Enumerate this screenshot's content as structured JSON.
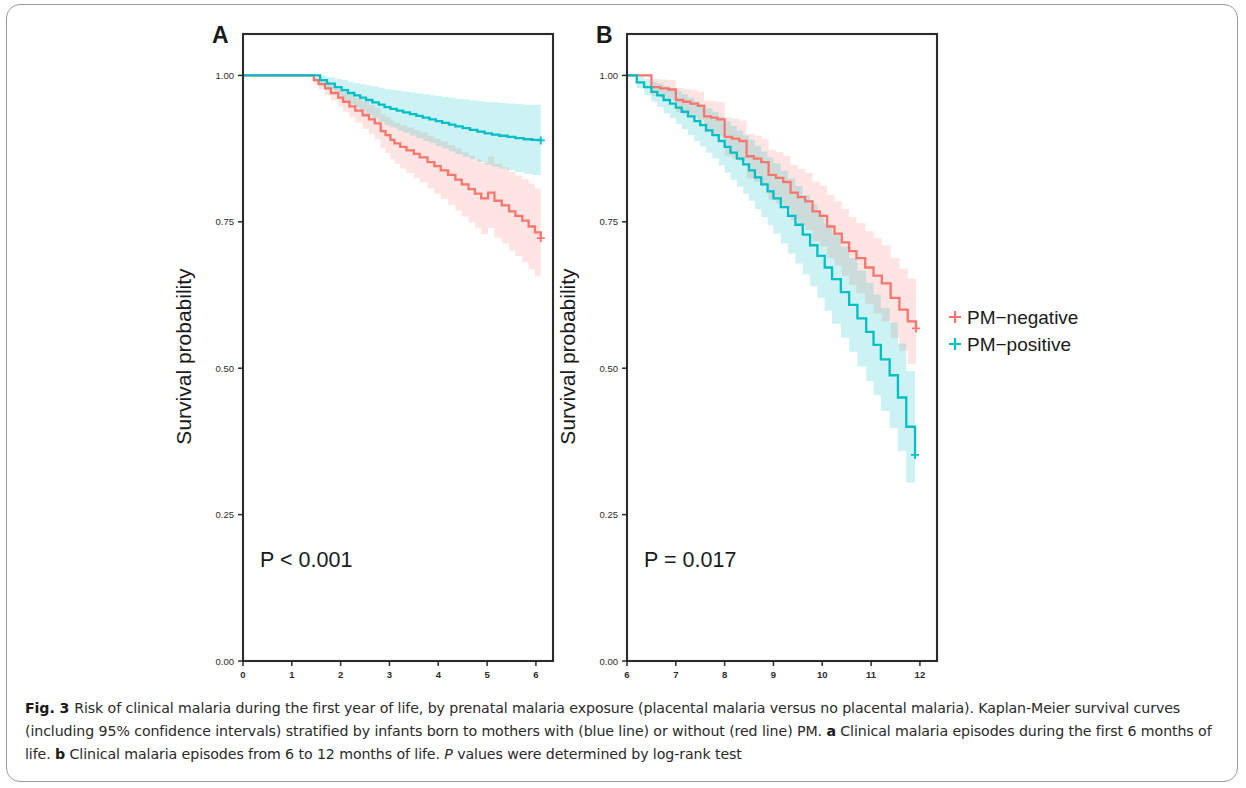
{
  "figure": {
    "label": "Fig. 3",
    "caption_segments": [
      {
        "text": "Fig. 3 ",
        "style": "bold"
      },
      {
        "text": "Risk of clinical malaria during the first year of life, by prenatal malaria exposure (placental malaria versus no placental malaria). Kaplan-Meier survival curves (including 95% confidence intervals) stratified by infants born to mothers with (blue line) or without (red line) PM. ",
        "style": "normal"
      },
      {
        "text": "a",
        "style": "bold"
      },
      {
        "text": " Clinical malaria episodes during the first 6 months of life. ",
        "style": "normal"
      },
      {
        "text": "b",
        "style": "bold"
      },
      {
        "text": " Clinical malaria episodes from 6 to 12 months of life. ",
        "style": "normal"
      },
      {
        "text": "P",
        "style": "italic"
      },
      {
        "text": " values were determined by log-rank test",
        "style": "normal"
      }
    ],
    "caption_plain": "Fig. 3 Risk of clinical malaria during the first year of life, by prenatal malaria exposure (placental malaria versus no placental malaria). Kaplan-Meier survival curves (including 95% confidence intervals) stratified by infants born to mothers with (blue line) or without (red line) PM. a Clinical malaria episodes during the first 6 months of life. b Clinical malaria episodes from 6 to 12 months of life. P values were determined by log-rank test"
  },
  "colors": {
    "pm_negative": "#F8766D",
    "pm_positive": "#00BFC4",
    "pm_negative_band": "#F8766D",
    "pm_positive_band": "#00BFC4",
    "axis": "#2b2b2b",
    "frame": "#9a9a9a",
    "text": "#1a1a1a"
  },
  "legend": {
    "position": "right",
    "items": [
      {
        "label": "PM−negative",
        "color": "#F8766D",
        "marker": "plus"
      },
      {
        "label": "PM−positive",
        "color": "#00BFC4",
        "marker": "plus"
      }
    ]
  },
  "chart_data": [
    {
      "type": "line",
      "panel": "A",
      "panel_letter": "A",
      "panel_ref": "a",
      "title": "",
      "xlabel": "Months to malaria",
      "ylabel": "Survival probability",
      "xlim": [
        0,
        6.35
      ],
      "ylim": [
        0,
        1.04
      ],
      "xticks": [
        0,
        1,
        2,
        3,
        4,
        5,
        6
      ],
      "xtick_labels": [
        "0",
        "1",
        "2",
        "3",
        "4",
        "5",
        "6"
      ],
      "yticks": [
        0.0,
        0.25,
        0.5,
        0.75,
        1.0
      ],
      "ytick_labels": [
        "0.00",
        "0.25",
        "0.50",
        "0.75",
        "1.00"
      ],
      "grid": false,
      "annotation": "P < 0.001",
      "annotation_x": 0.35,
      "annotation_y": 0.16,
      "series": [
        {
          "name": "PM−negative",
          "color": "#F8766D",
          "x": [
            0,
            1.3,
            1.45,
            1.55,
            1.68,
            1.8,
            1.95,
            2.05,
            2.18,
            2.3,
            2.45,
            2.58,
            2.7,
            2.82,
            2.92,
            3.02,
            3.1,
            3.22,
            3.35,
            3.5,
            3.62,
            3.78,
            3.92,
            4.05,
            4.2,
            4.35,
            4.48,
            4.62,
            4.75,
            4.88,
            5.02,
            5.15,
            5.3,
            5.45,
            5.58,
            5.72,
            5.85,
            5.98,
            6.1
          ],
          "y": [
            1.0,
            1.0,
            0.992,
            0.985,
            0.978,
            0.97,
            0.962,
            0.955,
            0.947,
            0.94,
            0.932,
            0.925,
            0.918,
            0.905,
            0.898,
            0.89,
            0.884,
            0.878,
            0.872,
            0.866,
            0.86,
            0.852,
            0.845,
            0.838,
            0.83,
            0.822,
            0.814,
            0.806,
            0.798,
            0.79,
            0.8,
            0.786,
            0.778,
            0.768,
            0.76,
            0.752,
            0.742,
            0.732,
            0.722
          ],
          "ci_lower": [
            1.0,
            1.0,
            0.985,
            0.976,
            0.967,
            0.957,
            0.947,
            0.938,
            0.928,
            0.919,
            0.909,
            0.9,
            0.891,
            0.876,
            0.867,
            0.857,
            0.849,
            0.841,
            0.833,
            0.825,
            0.817,
            0.807,
            0.798,
            0.789,
            0.779,
            0.769,
            0.759,
            0.749,
            0.739,
            0.729,
            0.739,
            0.723,
            0.713,
            0.701,
            0.691,
            0.681,
            0.669,
            0.657,
            0.645
          ],
          "ci_upper": [
            1.0,
            1.0,
            0.998,
            0.994,
            0.989,
            0.983,
            0.977,
            0.972,
            0.966,
            0.961,
            0.955,
            0.95,
            0.945,
            0.934,
            0.929,
            0.923,
            0.919,
            0.915,
            0.911,
            0.907,
            0.903,
            0.897,
            0.892,
            0.887,
            0.881,
            0.875,
            0.869,
            0.863,
            0.857,
            0.851,
            0.861,
            0.849,
            0.843,
            0.835,
            0.829,
            0.823,
            0.815,
            0.807,
            0.799
          ],
          "final_value": 0.722,
          "censor_marks": [
            [
              6.1,
              0.722
            ]
          ]
        },
        {
          "name": "PM−positive",
          "color": "#00BFC4",
          "x": [
            0,
            1.42,
            1.58,
            1.72,
            1.88,
            2.02,
            2.15,
            2.28,
            2.4,
            2.52,
            2.65,
            2.78,
            2.9,
            3.02,
            3.15,
            3.28,
            3.42,
            3.55,
            3.68,
            3.82,
            3.95,
            4.08,
            4.22,
            4.35,
            4.5,
            4.65,
            4.8,
            4.95,
            5.1,
            5.25,
            5.42,
            5.58,
            5.75,
            5.92,
            6.1
          ],
          "y": [
            1.0,
            1.0,
            0.992,
            0.986,
            0.98,
            0.975,
            0.97,
            0.966,
            0.962,
            0.958,
            0.954,
            0.95,
            0.946,
            0.943,
            0.94,
            0.937,
            0.934,
            0.931,
            0.928,
            0.925,
            0.922,
            0.919,
            0.916,
            0.913,
            0.91,
            0.907,
            0.904,
            0.901,
            0.899,
            0.897,
            0.895,
            0.893,
            0.891,
            0.89,
            0.889
          ],
          "ci_lower": [
            1.0,
            1.0,
            0.984,
            0.975,
            0.966,
            0.958,
            0.951,
            0.945,
            0.939,
            0.933,
            0.927,
            0.921,
            0.915,
            0.911,
            0.906,
            0.902,
            0.897,
            0.893,
            0.888,
            0.884,
            0.879,
            0.875,
            0.87,
            0.866,
            0.861,
            0.857,
            0.852,
            0.848,
            0.844,
            0.841,
            0.838,
            0.835,
            0.832,
            0.83,
            0.828
          ],
          "ci_upper": [
            1.0,
            1.0,
            0.999,
            0.997,
            0.994,
            0.992,
            0.989,
            0.987,
            0.985,
            0.983,
            0.981,
            0.979,
            0.977,
            0.975,
            0.974,
            0.972,
            0.971,
            0.969,
            0.968,
            0.966,
            0.965,
            0.963,
            0.962,
            0.96,
            0.959,
            0.957,
            0.956,
            0.954,
            0.954,
            0.953,
            0.952,
            0.951,
            0.95,
            0.95,
            0.95
          ],
          "final_value": 0.889,
          "censor_marks": [
            [
              6.1,
              0.889
            ]
          ]
        }
      ]
    },
    {
      "type": "line",
      "panel": "B",
      "panel_letter": "B",
      "panel_ref": "b",
      "title": "",
      "xlabel": "Months to malaria",
      "ylabel": "Survival probability",
      "xlim": [
        6,
        12.35
      ],
      "ylim": [
        0,
        1.04
      ],
      "xticks": [
        6,
        7,
        8,
        9,
        10,
        11,
        12
      ],
      "xtick_labels": [
        "6",
        "7",
        "8",
        "9",
        "10",
        "11",
        "12"
      ],
      "yticks": [
        0.0,
        0.25,
        0.5,
        0.75,
        1.0
      ],
      "ytick_labels": [
        "0.00",
        "0.25",
        "0.50",
        "0.75",
        "1.00"
      ],
      "grid": false,
      "annotation": "P = 0.017",
      "annotation_x": 6.35,
      "annotation_y": 0.16,
      "series": [
        {
          "name": "PM−negative",
          "color": "#F8766D",
          "x": [
            6.0,
            6.35,
            6.5,
            6.68,
            6.85,
            7.0,
            7.15,
            7.3,
            7.45,
            7.58,
            7.72,
            7.85,
            8.0,
            8.15,
            8.3,
            8.45,
            8.6,
            8.75,
            8.9,
            9.05,
            9.2,
            9.35,
            9.5,
            9.65,
            9.8,
            9.95,
            10.1,
            10.25,
            10.4,
            10.55,
            10.7,
            10.88,
            11.05,
            11.22,
            11.4,
            11.58,
            11.75,
            11.92
          ],
          "y": [
            1.0,
            1.0,
            0.98,
            0.978,
            0.976,
            0.958,
            0.955,
            0.952,
            0.948,
            0.93,
            0.928,
            0.925,
            0.895,
            0.892,
            0.888,
            0.862,
            0.858,
            0.852,
            0.83,
            0.825,
            0.818,
            0.8,
            0.792,
            0.785,
            0.768,
            0.76,
            0.742,
            0.73,
            0.715,
            0.7,
            0.688,
            0.672,
            0.658,
            0.645,
            0.62,
            0.6,
            0.58,
            0.568
          ],
          "ci_lower": [
            1.0,
            1.0,
            0.965,
            0.962,
            0.959,
            0.937,
            0.933,
            0.929,
            0.924,
            0.903,
            0.9,
            0.896,
            0.862,
            0.858,
            0.853,
            0.824,
            0.819,
            0.812,
            0.787,
            0.781,
            0.773,
            0.753,
            0.744,
            0.736,
            0.717,
            0.708,
            0.688,
            0.675,
            0.658,
            0.642,
            0.628,
            0.61,
            0.594,
            0.58,
            0.552,
            0.53,
            0.507,
            0.492
          ],
          "ci_upper": [
            1.0,
            1.0,
            0.994,
            0.993,
            0.992,
            0.979,
            0.977,
            0.975,
            0.972,
            0.957,
            0.956,
            0.954,
            0.928,
            0.926,
            0.923,
            0.9,
            0.897,
            0.892,
            0.873,
            0.869,
            0.863,
            0.847,
            0.84,
            0.834,
            0.819,
            0.812,
            0.796,
            0.785,
            0.772,
            0.758,
            0.748,
            0.734,
            0.722,
            0.71,
            0.688,
            0.67,
            0.653,
            0.644
          ],
          "final_value": 0.568,
          "censor_marks": [
            [
              11.92,
              0.568
            ]
          ]
        },
        {
          "name": "PM−positive",
          "color": "#00BFC4",
          "x": [
            6.0,
            6.2,
            6.35,
            6.5,
            6.62,
            6.75,
            6.88,
            7.0,
            7.12,
            7.25,
            7.38,
            7.5,
            7.62,
            7.75,
            7.88,
            8.0,
            8.12,
            8.25,
            8.38,
            8.5,
            8.62,
            8.75,
            8.88,
            9.0,
            9.15,
            9.3,
            9.45,
            9.6,
            9.75,
            9.9,
            10.05,
            10.2,
            10.38,
            10.55,
            10.72,
            10.9,
            11.05,
            11.2,
            11.38,
            11.55,
            11.72,
            11.9
          ],
          "y": [
            1.0,
            0.988,
            0.98,
            0.972,
            0.966,
            0.958,
            0.952,
            0.945,
            0.938,
            0.93,
            0.922,
            0.915,
            0.906,
            0.898,
            0.888,
            0.878,
            0.868,
            0.858,
            0.848,
            0.838,
            0.826,
            0.814,
            0.802,
            0.79,
            0.775,
            0.76,
            0.745,
            0.728,
            0.71,
            0.692,
            0.672,
            0.652,
            0.63,
            0.608,
            0.585,
            0.562,
            0.54,
            0.515,
            0.488,
            0.45,
            0.4,
            0.352
          ],
          "ci_lower": [
            1.0,
            0.978,
            0.966,
            0.955,
            0.946,
            0.935,
            0.927,
            0.917,
            0.908,
            0.898,
            0.888,
            0.879,
            0.868,
            0.858,
            0.846,
            0.834,
            0.822,
            0.81,
            0.798,
            0.786,
            0.772,
            0.758,
            0.744,
            0.73,
            0.713,
            0.696,
            0.679,
            0.66,
            0.64,
            0.62,
            0.598,
            0.576,
            0.552,
            0.528,
            0.503,
            0.478,
            0.454,
            0.427,
            0.398,
            0.358,
            0.305,
            0.254
          ],
          "ci_upper": [
            1.0,
            0.998,
            0.994,
            0.989,
            0.986,
            0.981,
            0.977,
            0.973,
            0.968,
            0.962,
            0.956,
            0.951,
            0.944,
            0.938,
            0.93,
            0.922,
            0.914,
            0.906,
            0.898,
            0.89,
            0.88,
            0.87,
            0.86,
            0.85,
            0.837,
            0.824,
            0.811,
            0.796,
            0.78,
            0.764,
            0.746,
            0.728,
            0.708,
            0.688,
            0.667,
            0.646,
            0.626,
            0.603,
            0.578,
            0.542,
            0.495,
            0.45
          ],
          "final_value": 0.352,
          "censor_marks": [
            [
              11.9,
              0.352
            ]
          ]
        }
      ]
    }
  ]
}
